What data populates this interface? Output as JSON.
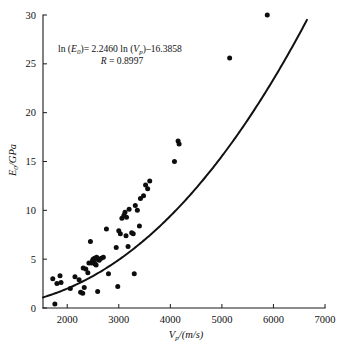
{
  "chart_data": {
    "type": "scatter",
    "title": "",
    "xlabel": "Vp/(m/s)",
    "ylabel": "E0/GPa",
    "xlim": [
      1530,
      7000
    ],
    "ylim": [
      0,
      30
    ],
    "grid": false,
    "legend": "none",
    "x_ticks": [
      2000,
      3000,
      4000,
      5000,
      6000,
      7000
    ],
    "y_ticks": [
      0,
      5,
      10,
      15,
      20,
      25,
      30
    ],
    "annotations": [
      "ln (E0)= 2.2460 ln (Vp)-16.3858",
      "R = 0.8997"
    ],
    "regression": {
      "equation": "ln (E0) = 2.2460 ln (Vp) - 16.3858",
      "slope": 2.246,
      "intercept": -16.3858,
      "correlation": 0.8997,
      "curve_x_start": 1530,
      "curve_x_end": 6650
    },
    "points": [
      {
        "x": 1720,
        "y": 3.0
      },
      {
        "x": 1760,
        "y": 0.4
      },
      {
        "x": 1800,
        "y": 2.5
      },
      {
        "x": 1860,
        "y": 3.3
      },
      {
        "x": 1880,
        "y": 2.6
      },
      {
        "x": 2060,
        "y": 2.0
      },
      {
        "x": 2150,
        "y": 3.2
      },
      {
        "x": 2230,
        "y": 2.9
      },
      {
        "x": 2260,
        "y": 1.6
      },
      {
        "x": 2300,
        "y": 1.5
      },
      {
        "x": 2310,
        "y": 4.1
      },
      {
        "x": 2330,
        "y": 2.1
      },
      {
        "x": 2360,
        "y": 4.0
      },
      {
        "x": 2400,
        "y": 3.6
      },
      {
        "x": 2420,
        "y": 4.6
      },
      {
        "x": 2450,
        "y": 6.8
      },
      {
        "x": 2470,
        "y": 4.6
      },
      {
        "x": 2490,
        "y": 4.8
      },
      {
        "x": 2500,
        "y": 5.0
      },
      {
        "x": 2510,
        "y": 4.9
      },
      {
        "x": 2530,
        "y": 5.1
      },
      {
        "x": 2540,
        "y": 4.5
      },
      {
        "x": 2550,
        "y": 5.0
      },
      {
        "x": 2560,
        "y": 4.4
      },
      {
        "x": 2570,
        "y": 5.2
      },
      {
        "x": 2590,
        "y": 1.7
      },
      {
        "x": 2600,
        "y": 5.0
      },
      {
        "x": 2620,
        "y": 4.9
      },
      {
        "x": 2660,
        "y": 5.1
      },
      {
        "x": 2700,
        "y": 5.2
      },
      {
        "x": 2760,
        "y": 8.1
      },
      {
        "x": 2800,
        "y": 3.5
      },
      {
        "x": 2950,
        "y": 6.2
      },
      {
        "x": 2980,
        "y": 2.2
      },
      {
        "x": 3000,
        "y": 7.9
      },
      {
        "x": 3030,
        "y": 7.6
      },
      {
        "x": 3060,
        "y": 9.2
      },
      {
        "x": 3100,
        "y": 9.5
      },
      {
        "x": 3120,
        "y": 9.8
      },
      {
        "x": 3140,
        "y": 7.4
      },
      {
        "x": 3150,
        "y": 9.3
      },
      {
        "x": 3180,
        "y": 6.3
      },
      {
        "x": 3200,
        "y": 10.1
      },
      {
        "x": 3250,
        "y": 7.7
      },
      {
        "x": 3280,
        "y": 7.6
      },
      {
        "x": 3300,
        "y": 3.5
      },
      {
        "x": 3320,
        "y": 10.5
      },
      {
        "x": 3360,
        "y": 10.0
      },
      {
        "x": 3400,
        "y": 8.4
      },
      {
        "x": 3420,
        "y": 11.2
      },
      {
        "x": 3480,
        "y": 11.5
      },
      {
        "x": 3520,
        "y": 12.6
      },
      {
        "x": 3560,
        "y": 12.2
      },
      {
        "x": 3600,
        "y": 13.0
      },
      {
        "x": 4080,
        "y": 15.0
      },
      {
        "x": 4150,
        "y": 17.1
      },
      {
        "x": 4170,
        "y": 16.8
      },
      {
        "x": 5150,
        "y": 25.6
      },
      {
        "x": 5880,
        "y": 30.0
      }
    ]
  }
}
